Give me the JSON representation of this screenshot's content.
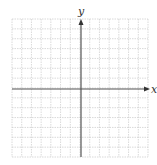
{
  "diagram": {
    "type": "coordinate-plane",
    "axes": {
      "x_label": "x",
      "y_label": "y"
    },
    "grid": {
      "columns": 14,
      "rows": 14,
      "columns_left_of_y_axis": 7,
      "rows_above_x_axis": 7
    },
    "colors": {
      "grid_line": "#c8c8c8",
      "axis_line": "#555555",
      "label": "#333333"
    }
  }
}
